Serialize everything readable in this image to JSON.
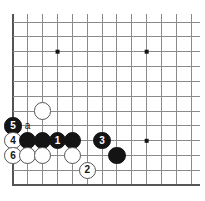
{
  "diagram": {
    "kind": "go-board-diagram",
    "board": {
      "line_color": "#8a8a8a",
      "border_color": "#555555",
      "background_color": "#ffffff",
      "columns": 13,
      "rows": 12,
      "origin_x": 13,
      "origin_y": 22,
      "spacing": 14.85,
      "left_edge_is_board_border": true,
      "bottom_edge_is_board_border": true,
      "star_points": [
        {
          "col": 3,
          "row": 2
        },
        {
          "col": 9,
          "row": 2
        },
        {
          "col": 9,
          "row": 8
        }
      ]
    },
    "stone_colors": {
      "black": "#141414",
      "white": "#ffffff",
      "white_outline": "#555555",
      "black_number": "#ffffff",
      "white_number": "#141414"
    },
    "stones": [
      {
        "id": "w-unnumbered-c2r6",
        "col": 2,
        "row": 6,
        "color": "white",
        "label": ""
      },
      {
        "id": "b-move-5",
        "col": 0,
        "row": 7,
        "color": "black",
        "label": "5"
      },
      {
        "id": "w-move-4",
        "col": 0,
        "row": 8,
        "color": "white",
        "label": "4"
      },
      {
        "id": "w-move-6",
        "col": 0,
        "row": 9,
        "color": "white",
        "label": "6"
      },
      {
        "id": "b-unnumbered-c1r8",
        "col": 1,
        "row": 8,
        "color": "black",
        "label": ""
      },
      {
        "id": "b-unnumbered-c2r8",
        "col": 2,
        "row": 8,
        "color": "black",
        "label": ""
      },
      {
        "id": "b-move-1",
        "col": 3,
        "row": 8,
        "color": "black",
        "label": "1"
      },
      {
        "id": "b-unnumbered-c4r8",
        "col": 4,
        "row": 8,
        "color": "black",
        "label": ""
      },
      {
        "id": "b-move-3",
        "col": 6,
        "row": 8,
        "color": "black",
        "label": "3"
      },
      {
        "id": "w-unnumbered-c1r9",
        "col": 1,
        "row": 9,
        "color": "white",
        "label": ""
      },
      {
        "id": "w-unnumbered-c2r9",
        "col": 2,
        "row": 9,
        "color": "white",
        "label": ""
      },
      {
        "id": "w-unnumbered-c4r9",
        "col": 4,
        "row": 9,
        "color": "white",
        "label": ""
      },
      {
        "id": "b-unnumbered-c7r9",
        "col": 7,
        "row": 9,
        "color": "black",
        "label": ""
      },
      {
        "id": "w-move-2",
        "col": 5,
        "row": 10,
        "color": "white",
        "label": "2"
      }
    ],
    "point_labels": [
      {
        "id": "label-a",
        "col": 1,
        "row": 7,
        "text": "a"
      }
    ]
  }
}
